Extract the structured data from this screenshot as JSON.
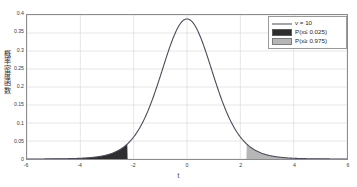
{
  "chart_data": {
    "type": "line",
    "title": "",
    "xlabel": "t",
    "ylabel": "概率密度函数",
    "xlim": [
      -6,
      6
    ],
    "ylim": [
      0,
      0.4
    ],
    "grid": true,
    "xticks": [
      "-6",
      "-4",
      "-2",
      "0",
      "2",
      "4",
      "6"
    ],
    "xtick_values": [
      -6,
      -4,
      -2,
      0,
      2,
      4,
      6
    ],
    "yticks": [
      "0",
      "0.05",
      "0.1",
      "0.15",
      "0.2",
      "0.25",
      "0.3",
      "0.35",
      "0.4"
    ],
    "ytick_values": [
      0,
      0.05,
      0.1,
      0.15,
      0.2,
      0.25,
      0.3,
      0.35,
      0.4
    ],
    "legend_position": "upper right",
    "series": [
      {
        "name": "ν = 10",
        "kind": "line",
        "color": "#4a4a5a",
        "peak_value": 0.3891,
        "peak_x": 0,
        "x": [
          -6,
          -5.5,
          -5,
          -4.5,
          -4,
          -3.5,
          -3,
          -2.764,
          -2.5,
          -2.228,
          -2,
          -1.5,
          -1,
          -0.5,
          0,
          0.5,
          1,
          1.5,
          2,
          2.228,
          2.5,
          2.764,
          3,
          3.5,
          4,
          4.5,
          5,
          5.5,
          6
        ],
        "y": [
          0.0009,
          0.0015,
          0.0027,
          0.0049,
          0.0093,
          0.0183,
          0.0378,
          0.0536,
          0.0756,
          0.1068,
          0.1331,
          0.1924,
          0.2557,
          0.3189,
          0.3891,
          0.3189,
          0.2557,
          0.1924,
          0.1331,
          0.1068,
          0.0756,
          0.0536,
          0.0378,
          0.0183,
          0.0093,
          0.0049,
          0.0027,
          0.0015,
          0.0009
        ]
      },
      {
        "name": "P(x≤ 0.025)",
        "kind": "area",
        "color": "#2e2e2e",
        "x_from": -6,
        "x_to": -2.228
      },
      {
        "name": "P(x≥ 0.975)",
        "kind": "area",
        "color": "#b6b6b6",
        "x_from": 2.228,
        "x_to": 6
      }
    ]
  },
  "legend": {
    "items": [
      {
        "label": "ν = 10",
        "key": "line"
      },
      {
        "label": "P(x≤  0.025)",
        "key": "swatch-dark"
      },
      {
        "label": "P(x≥  0.975)",
        "key": "swatch-light"
      }
    ]
  },
  "axes": {
    "xlabel": "t",
    "ylabel": "概率密度函数"
  }
}
